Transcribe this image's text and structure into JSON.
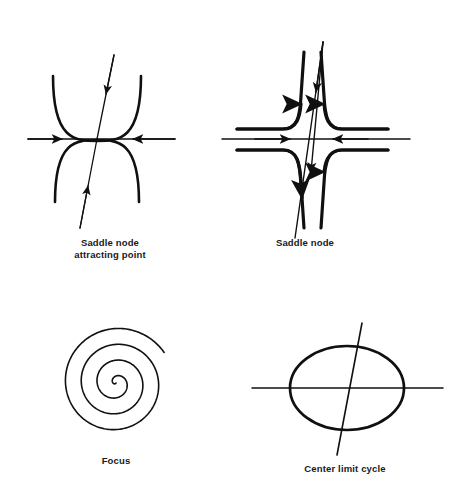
{
  "figure": {
    "background_color": "#ffffff",
    "stroke_color": "#101010",
    "width": 460,
    "height": 492
  },
  "panels": [
    {
      "id": "saddle-node-attracting-point",
      "caption": "Saddle node\nattracting point",
      "center": {
        "x": 97,
        "y": 139
      },
      "elements": [
        "horizontal-axis-with-inward-arrows",
        "slanted-axis-with-inward-arrows",
        "upper-parabola-arc",
        "lower-parabola-arc"
      ]
    },
    {
      "id": "saddle-node",
      "caption": "Saddle node",
      "center": {
        "x": 311,
        "y": 139
      },
      "elements": [
        "horizontal-axis-with-inward-arrows",
        "slanted-axis-with-inward-arrows",
        "hyperbola-branch-upper-left",
        "hyperbola-branch-upper-right",
        "hyperbola-branch-lower-left",
        "hyperbola-branch-lower-right"
      ]
    },
    {
      "id": "focus",
      "caption": "Focus",
      "center": {
        "x": 116,
        "y": 383
      },
      "elements": [
        "archimedean-spiral"
      ],
      "spiral_turns": 3.6,
      "spiral_outer_radius": 57
    },
    {
      "id": "center-limit-cycle",
      "caption": "Center limit cycle",
      "center": {
        "x": 347,
        "y": 388
      },
      "elements": [
        "ellipse-limit-cycle",
        "horizontal-axis",
        "slanted-axis"
      ],
      "ellipse_rx": 57,
      "ellipse_ry": 42
    }
  ],
  "chart_data": {
    "type": "diagram",
    "title": "",
    "subtitle": "",
    "panel_labels": [
      "Saddle node attracting point",
      "Saddle node",
      "Focus",
      "Center limit cycle"
    ]
  }
}
